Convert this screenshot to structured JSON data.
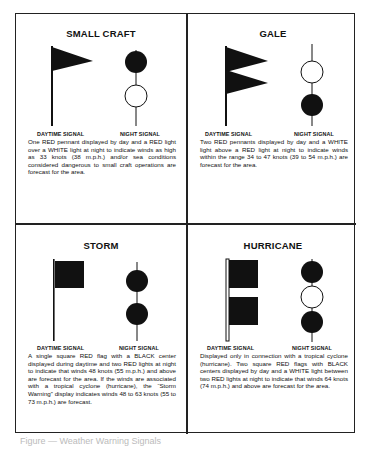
{
  "panels": [
    {
      "id": "small-craft",
      "title": "SMALL CRAFT",
      "day_label": "DAYTIME SIGNAL",
      "night_label": "NIGHT SIGNAL",
      "day_signal": "one red pennant",
      "night_signal": [
        "red",
        "white"
      ],
      "description": "One RED pennant displayed by day and a RED light over a WHITE light at night to indicate winds as high as 33 knots (38 m.p.h.) and/or sea conditions considered dangerous to small craft operations are forecast for the area."
    },
    {
      "id": "gale",
      "title": "GALE",
      "day_label": "DAYTIME SIGNAL",
      "night_label": "NIGHT SIGNAL",
      "day_signal": "two red pennants",
      "night_signal": [
        "white",
        "red"
      ],
      "description": "Two RED pennants displayed by day and a WHITE light above a RED light at night to indicate winds within the range 34 to 47 knots (39 to 54 m.p.h.) are forecast for the area."
    },
    {
      "id": "storm",
      "title": "STORM",
      "day_label": "DAYTIME SIGNAL",
      "night_label": "NIGHT SIGNAL",
      "day_signal": "one square red flag with black center",
      "night_signal": [
        "red",
        "red"
      ],
      "description": "A single square RED flag with a BLACK center displayed during daytime and two RED lights at night to indicate that winds 48 knots (55 m.p.h.) and above are forecast for the area. If the winds are associated with a tropical cyclone (hurricane), the “Storm Warning” display indicates winds 48 to 63 knots (55 to 73 m.p.h.) are forecast."
    },
    {
      "id": "hurricane",
      "title": "HURRICANE",
      "day_label": "DAYTIME SIGNAL",
      "night_label": "NIGHT SIGNAL",
      "day_signal": "two square red flags with black centers",
      "night_signal": [
        "red",
        "white",
        "red"
      ],
      "description": "Displayed only in connection with a tropical cyclone (hurricane). Two square RED flags with BLACK centers displayed by day and a WHITE light between two RED lights at night to indicate that winds 64 knots (74 m.p.h.) and above are forecast for the area."
    }
  ],
  "caption": "Figure — Weather Warning Signals",
  "colors": {
    "ink": "#111111",
    "border": "#222222",
    "light_off": "#ffffff"
  }
}
